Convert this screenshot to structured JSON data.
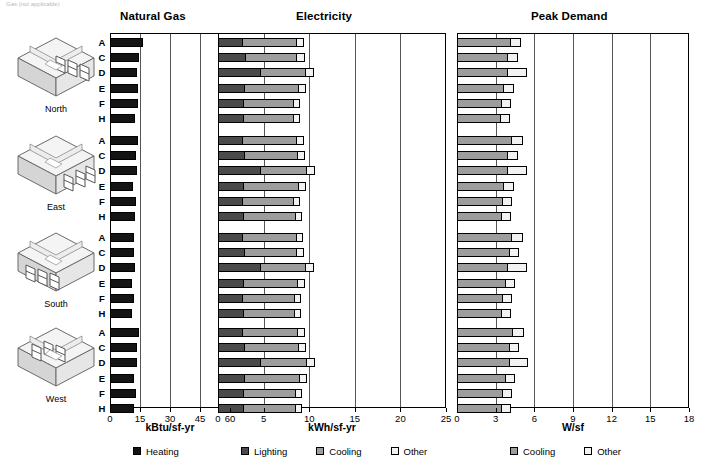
{
  "caption": "Gas (not applicable)",
  "titles": {
    "natural_gas": "Natural Gas",
    "electricity": "Electricity",
    "peak_demand": "Peak Demand"
  },
  "axis_titles": {
    "natural_gas": "kBtu/sf-yr",
    "electricity": "kWh/sf-yr",
    "peak_demand": "W/sf"
  },
  "axis_ticks": {
    "natural_gas": [
      "0",
      "15",
      "30",
      "45",
      "60"
    ],
    "electricity": [
      "0",
      "5",
      "10",
      "15",
      "20",
      "25"
    ],
    "peak_demand": [
      "0",
      "3",
      "6",
      "9",
      "12",
      "15",
      "18"
    ]
  },
  "row_labels": [
    "A",
    "C",
    "D",
    "E",
    "F",
    "H"
  ],
  "orientations": [
    {
      "label": "North",
      "icon": "isometric-room-north"
    },
    {
      "label": "East",
      "icon": "isometric-room-east"
    },
    {
      "label": "South",
      "icon": "isometric-room-south"
    },
    {
      "label": "West",
      "icon": "isometric-room-west"
    }
  ],
  "legend_gas": [
    {
      "label": "Heating",
      "color": "#141414",
      "key": "heating"
    }
  ],
  "legend_elec": [
    {
      "label": "Lighting",
      "color": "#4a4a4a",
      "key": "lighting"
    },
    {
      "label": "Cooling",
      "color": "#9d9d9d",
      "key": "cooling"
    },
    {
      "label": "Other",
      "color": "#f2f2f2",
      "key": "other"
    }
  ],
  "legend_peak": [
    {
      "label": "Cooling",
      "color": "#9d9d9d",
      "key": "cooling"
    },
    {
      "label": "Other",
      "color": "#f2f2f2",
      "key": "other"
    }
  ],
  "chart_data": {
    "type": "bar",
    "orientation": "horizontal",
    "stacked": true,
    "grid": true,
    "legend_position": "bottom",
    "groups": [
      "North",
      "East",
      "South",
      "West"
    ],
    "categories": [
      "A",
      "C",
      "D",
      "E",
      "F",
      "H"
    ],
    "panels": [
      {
        "name": "Natural Gas",
        "xlabel": "kBtu/sf-yr",
        "xlim": [
          0,
          60
        ],
        "xticks": [
          0,
          15,
          30,
          45,
          60
        ],
        "series": [
          {
            "name": "Heating",
            "color": "#141414"
          }
        ],
        "data": {
          "North": {
            "Heating": [
              16.5,
              14.5,
              13.5,
              14.0,
              14.0,
              12.5
            ]
          },
          "East": {
            "Heating": [
              14.0,
              13.0,
              13.5,
              11.5,
              13.0,
              12.5
            ]
          },
          "South": {
            "Heating": [
              12.0,
              12.0,
              12.5,
              11.0,
              12.0,
              11.0
            ]
          },
          "West": {
            "Heating": [
              14.5,
              13.5,
              13.5,
              12.0,
              13.0,
              12.0
            ]
          }
        }
      },
      {
        "name": "Electricity",
        "xlabel": "kWh/sf-yr",
        "xlim": [
          0,
          25
        ],
        "xticks": [
          0,
          5,
          10,
          15,
          20,
          25
        ],
        "series": [
          {
            "name": "Lighting",
            "color": "#4a4a4a"
          },
          {
            "name": "Cooling",
            "color": "#9d9d9d"
          },
          {
            "name": "Other",
            "color": "#f2f2f2"
          }
        ],
        "data": {
          "North": {
            "Lighting": [
              2.6,
              3.0,
              4.6,
              2.8,
              2.7,
              2.7
            ],
            "Cooling": [
              6.0,
              5.6,
              4.9,
              6.0,
              5.5,
              5.5
            ],
            "Other": [
              0.8,
              0.9,
              1.0,
              0.9,
              0.8,
              0.8
            ]
          },
          "East": {
            "Lighting": [
              2.6,
              2.8,
              4.6,
              2.7,
              2.6,
              2.7
            ],
            "Cooling": [
              6.0,
              5.9,
              5.0,
              6.1,
              5.6,
              5.7
            ],
            "Other": [
              0.8,
              0.8,
              1.0,
              0.9,
              0.8,
              0.8
            ]
          },
          "South": {
            "Lighting": [
              2.6,
              2.8,
              4.6,
              2.7,
              2.6,
              2.7
            ],
            "Cooling": [
              5.9,
              5.8,
              4.9,
              6.0,
              5.7,
              5.6
            ],
            "Other": [
              0.8,
              0.8,
              1.0,
              0.8,
              0.8,
              0.8
            ]
          },
          "West": {
            "Lighting": [
              2.6,
              2.9,
              4.6,
              2.8,
              2.7,
              2.7
            ],
            "Cooling": [
              6.1,
              5.9,
              5.0,
              6.1,
              5.7,
              5.7
            ],
            "Other": [
              0.8,
              0.9,
              1.0,
              0.9,
              0.8,
              0.8
            ]
          }
        }
      },
      {
        "name": "Peak Demand",
        "xlabel": "W/sf",
        "xlim": [
          0,
          18
        ],
        "xticks": [
          0,
          3,
          6,
          9,
          12,
          15,
          18
        ],
        "series": [
          {
            "name": "Cooling",
            "color": "#9d9d9d"
          },
          {
            "name": "Other",
            "color": "#f2f2f2"
          }
        ],
        "data": {
          "North": {
            "Cooling": [
              4.1,
              3.9,
              3.9,
              3.6,
              3.4,
              3.3
            ],
            "Other": [
              0.9,
              0.8,
              1.5,
              0.8,
              0.8,
              0.8
            ]
          },
          "East": {
            "Cooling": [
              4.2,
              3.9,
              3.9,
              3.6,
              3.5,
              3.4
            ],
            "Other": [
              0.9,
              0.8,
              1.5,
              0.8,
              0.8,
              0.8
            ]
          },
          "South": {
            "Cooling": [
              4.2,
              4.0,
              3.9,
              3.7,
              3.5,
              3.4
            ],
            "Other": [
              0.9,
              0.8,
              1.5,
              0.8,
              0.8,
              0.8
            ]
          },
          "West": {
            "Cooling": [
              4.3,
              4.0,
              4.0,
              3.7,
              3.5,
              3.4
            ],
            "Other": [
              0.9,
              0.8,
              1.5,
              0.8,
              0.8,
              0.8
            ]
          }
        }
      }
    ]
  }
}
